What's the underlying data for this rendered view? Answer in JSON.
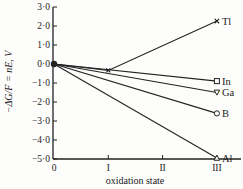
{
  "chart_data": {
    "type": "line",
    "title": "",
    "xlabel": "oxidation state",
    "ylabel": "−ΔG/F = nE, V",
    "x": [
      0,
      1,
      2,
      3
    ],
    "x_tick_labels": [
      "0",
      "I",
      "II",
      "III"
    ],
    "y_ticks": [
      3.0,
      2.0,
      1.0,
      0.0,
      -1.0,
      -2.0,
      -3.0,
      -4.0,
      -5.0
    ],
    "y_tick_labels": [
      "3·0",
      "2·0",
      "1·0",
      "0·0",
      "−1·0",
      "−2·0",
      "−3·0",
      "−4·0",
      "−5·0"
    ],
    "ylim": [
      -5.0,
      3.0
    ],
    "xlim": [
      0,
      3
    ],
    "grid": false,
    "legend": "inline labels at right end of each line",
    "series": [
      {
        "name": "Tl",
        "marker": "cross",
        "points": [
          [
            0,
            0.0
          ],
          [
            1,
            -0.34
          ],
          [
            3,
            2.26
          ]
        ]
      },
      {
        "name": "In",
        "marker": "square",
        "points": [
          [
            0,
            0.0
          ],
          [
            3,
            -0.9
          ]
        ]
      },
      {
        "name": "Ga",
        "marker": "triangle-down",
        "points": [
          [
            0,
            0.0
          ],
          [
            3,
            -1.5
          ]
        ]
      },
      {
        "name": "B",
        "marker": "circle",
        "points": [
          [
            0,
            0.0
          ],
          [
            3,
            -2.6
          ]
        ]
      },
      {
        "name": "Al",
        "marker": "triangle-up",
        "points": [
          [
            0,
            0.0
          ],
          [
            3,
            -4.95
          ]
        ]
      }
    ],
    "colors": {
      "line": "#222222",
      "background": "#fdfdfb"
    }
  }
}
